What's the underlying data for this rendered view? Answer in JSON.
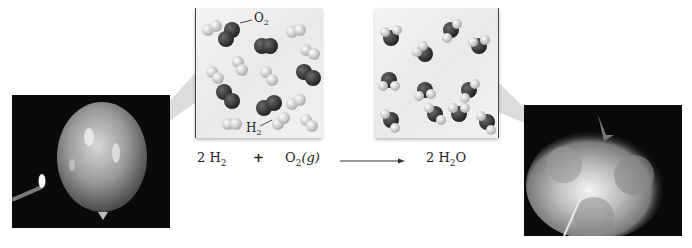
{
  "figure": {
    "left_photo": {
      "description": "hydrogen-oxygen balloon with lit match"
    },
    "right_photo": {
      "description": "balloon exploding into fireball"
    },
    "reactant_panel": {
      "labels": {
        "o2": "O",
        "o2_sub": "2",
        "h2": "H",
        "h2_sub": "2"
      },
      "molecules": {
        "o2_count": 6,
        "h2_count": 12
      }
    },
    "product_panel": {
      "molecules": {
        "h2o_count": 11
      }
    },
    "equation": {
      "reactant1_coef": "2 H",
      "reactant1_sub": "2",
      "plus": "+",
      "reactant2": "O",
      "reactant2_sub": "2",
      "reactant2_state": "(g)",
      "product_coef": "2 H",
      "product_sub": "2",
      "product_tail": "O"
    },
    "colors": {
      "oxygen": "#3a3a3a",
      "hydrogen": "#e6e6e6",
      "photo_bg": "#0a0a0a",
      "callout": "#d0d0d0"
    }
  }
}
